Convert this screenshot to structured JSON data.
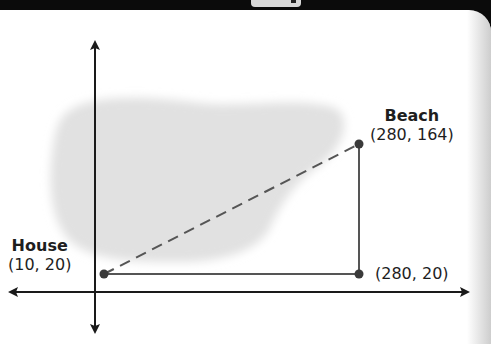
{
  "diagram": {
    "type": "coordinate-plane-map",
    "points": [
      {
        "id": "house",
        "name": "House",
        "coords": "(10, 20)",
        "x": 10,
        "y": 20
      },
      {
        "id": "beach",
        "name": "Beach",
        "coords": "(280, 164)",
        "x": 280,
        "y": 164
      },
      {
        "id": "corner",
        "name": "",
        "coords": "(280, 20)",
        "x": 280,
        "y": 20
      }
    ],
    "segments": [
      {
        "from": "house",
        "to": "beach",
        "style": "dashed"
      },
      {
        "from": "house",
        "to": "corner",
        "style": "solid"
      },
      {
        "from": "corner",
        "to": "beach",
        "style": "solid"
      }
    ],
    "region": {
      "name": "lake",
      "color": "#e3e3e3"
    },
    "colors": {
      "axis": "#1a1a1a",
      "segment": "#555555",
      "point": "#3a3a3a"
    }
  }
}
